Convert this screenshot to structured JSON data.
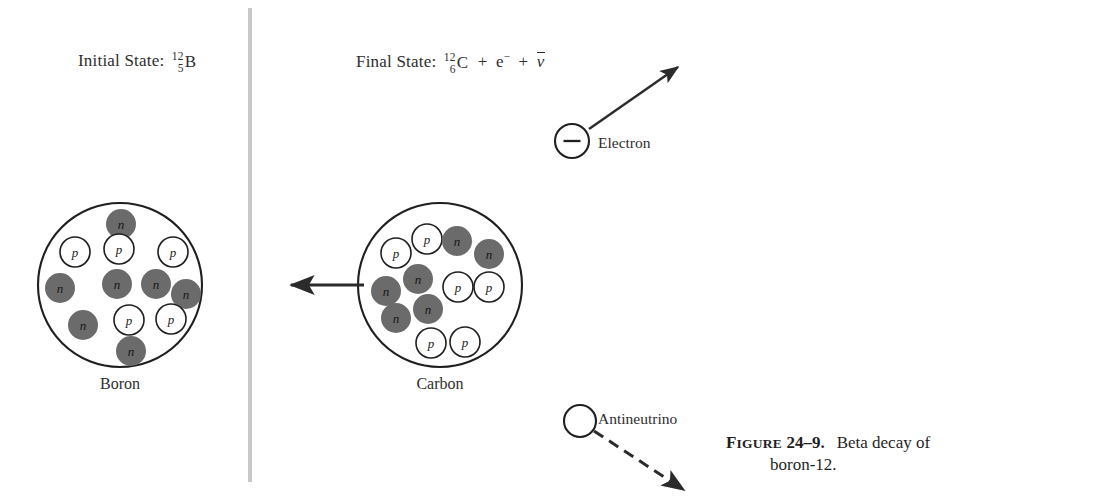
{
  "figure": {
    "number_prefix": "F",
    "number_rest": "IGURE",
    "number_value": "24–9.",
    "caption_line1": "Beta decay of",
    "caption_line2": "boron-12."
  },
  "colors": {
    "background": "#ffffff",
    "ink": "#2e2e2e",
    "neutron_fill": "#6b6b6b",
    "proton_fill": "#ffffff",
    "proton_stroke": "#1f1f1f",
    "divider": "#c8c8c8",
    "nucleus_stroke": "#1f1f1f"
  },
  "divider": {
    "name": "panel-divider",
    "x": 250,
    "y_top": 8,
    "y_bottom": 482,
    "width": 4
  },
  "initial_state": {
    "label": "Initial State:",
    "mass_number": "12",
    "atomic_number": "5",
    "symbol": "B"
  },
  "final_state": {
    "label": "Final State:",
    "mass_number": "12",
    "atomic_number": "6",
    "symbol": "C",
    "plus1": "+",
    "electron": "e",
    "electron_charge": "−",
    "plus2": "+",
    "antineutrino": "ν"
  },
  "nuclei": [
    {
      "id": "boron",
      "name": "Boron",
      "cx": 120,
      "cy": 285,
      "r": 82,
      "proton_count": 5,
      "neutron_count": 7,
      "proton_symbol": "p",
      "neutron_symbol": "n",
      "nucleons": [
        {
          "type": "neutron",
          "x": 121,
          "y": 224,
          "r": 15
        },
        {
          "type": "proton",
          "x": 75,
          "y": 252,
          "r": 15
        },
        {
          "type": "proton",
          "x": 119,
          "y": 249,
          "r": 15
        },
        {
          "type": "proton",
          "x": 173,
          "y": 252,
          "r": 15
        },
        {
          "type": "neutron",
          "x": 60,
          "y": 288,
          "r": 15
        },
        {
          "type": "neutron",
          "x": 117,
          "y": 284,
          "r": 15
        },
        {
          "type": "neutron",
          "x": 156,
          "y": 284,
          "r": 15
        },
        {
          "type": "neutron",
          "x": 186,
          "y": 294,
          "r": 15
        },
        {
          "type": "neutron",
          "x": 83,
          "y": 325,
          "r": 15
        },
        {
          "type": "proton",
          "x": 129,
          "y": 320,
          "r": 15
        },
        {
          "type": "proton",
          "x": 171,
          "y": 319,
          "r": 15
        },
        {
          "type": "neutron",
          "x": 131,
          "y": 351,
          "r": 15
        }
      ]
    },
    {
      "id": "carbon",
      "name": "Carbon",
      "cx": 440,
      "cy": 285,
      "r": 82,
      "proton_count": 6,
      "neutron_count": 6,
      "proton_symbol": "p",
      "neutron_symbol": "n",
      "nucleons": [
        {
          "type": "proton",
          "x": 427,
          "y": 239,
          "r": 15
        },
        {
          "type": "neutron",
          "x": 457,
          "y": 241,
          "r": 15
        },
        {
          "type": "proton",
          "x": 396,
          "y": 253,
          "r": 15
        },
        {
          "type": "neutron",
          "x": 489,
          "y": 254,
          "r": 15
        },
        {
          "type": "neutron",
          "x": 418,
          "y": 279,
          "r": 15
        },
        {
          "type": "proton",
          "x": 458,
          "y": 287,
          "r": 15
        },
        {
          "type": "proton",
          "x": 489,
          "y": 287,
          "r": 15
        },
        {
          "type": "neutron",
          "x": 386,
          "y": 291,
          "r": 15
        },
        {
          "type": "neutron",
          "x": 428,
          "y": 309,
          "r": 15
        },
        {
          "type": "neutron",
          "x": 396,
          "y": 318,
          "r": 15
        },
        {
          "type": "proton",
          "x": 431,
          "y": 343,
          "r": 15
        },
        {
          "type": "proton",
          "x": 465,
          "y": 342,
          "r": 15
        }
      ]
    }
  ],
  "decay_arrow": {
    "name": "decay-arrow",
    "x1": 364,
    "y1": 285,
    "x2": 291,
    "y2": 285
  },
  "electron": {
    "label": "Electron",
    "charge_glyph": "−",
    "cx": 572,
    "cy": 141,
    "r": 17,
    "arrow": {
      "x1": 589,
      "y1": 129,
      "x2": 678,
      "y2": 67
    }
  },
  "antineutrino": {
    "label": "Antineutrino",
    "cx": 580,
    "cy": 421,
    "r": 16,
    "arrow": {
      "x1": 594,
      "y1": 431,
      "x2": 684,
      "y2": 490
    }
  }
}
